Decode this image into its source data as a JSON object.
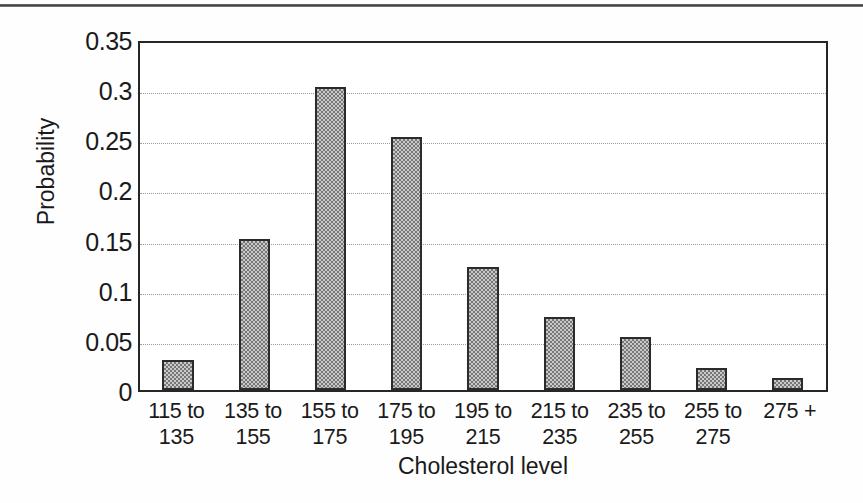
{
  "chart_data": {
    "type": "bar",
    "title": "",
    "subtitle": "",
    "xlabel": "Cholesterol level",
    "ylabel": "Probability",
    "categories": [
      "115 to\n135",
      "135 to\n155",
      "155 to\n175",
      "175 to\n195",
      "195 to\n215",
      "215 to\n235",
      "235 to\n255",
      "255 to\n275",
      "275 +"
    ],
    "values": [
      0.03,
      0.151,
      0.302,
      0.252,
      0.123,
      0.073,
      0.053,
      0.022,
      0.012
    ],
    "ylim": [
      0,
      0.35
    ],
    "ytick_labels": [
      "0",
      "0.05",
      "0.1",
      "0.15",
      "0.2",
      "0.25",
      "0.3",
      "0.35"
    ],
    "ytick_values": [
      0,
      0.05,
      0.1,
      0.15,
      0.2,
      0.25,
      0.3,
      0.35
    ],
    "grid": true,
    "grid_orientation": "horizontal",
    "legend": false,
    "legend_position": "none",
    "bar_fill_color": "#9b9b9b",
    "bar_edge_color": "#2b2b2b",
    "plot_border_color": "#262626",
    "gridline_color": "#9a9a9a",
    "background_color": "#ffffff"
  }
}
